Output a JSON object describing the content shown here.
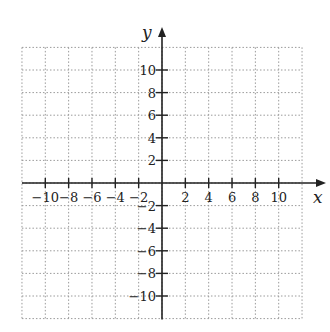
{
  "chart_data": {
    "type": "scatter",
    "title": "",
    "xlabel": "x",
    "ylabel": "y",
    "xlim": [
      -12,
      12
    ],
    "ylim": [
      -12,
      12
    ],
    "grid": true,
    "grid_style": "dotted",
    "x_ticks": [
      -10,
      -8,
      -6,
      -4,
      -2,
      2,
      4,
      6,
      8,
      10
    ],
    "y_ticks": [
      10,
      8,
      6,
      4,
      2,
      -2,
      -4,
      -6,
      -8,
      -10
    ],
    "x_tick_labels": [
      "−10",
      "−8",
      "−6",
      "−4",
      "−2",
      "2",
      "4",
      "6",
      "8",
      "10"
    ],
    "y_tick_labels": [
      "10",
      "8",
      "6",
      "4",
      "2",
      "−2",
      "−4",
      "−6",
      "−8",
      "−10"
    ],
    "series": []
  },
  "colors": {
    "axis": "#222222",
    "grid": "#9a9a9a"
  }
}
